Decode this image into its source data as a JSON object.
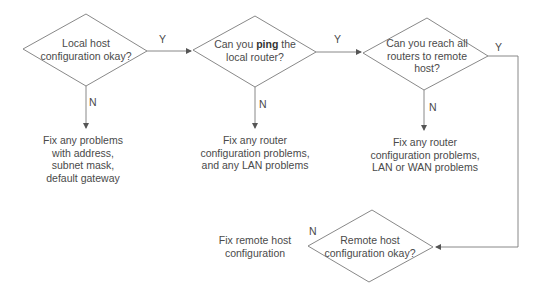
{
  "decisions": [
    {
      "id": "d1",
      "lines": [
        "Local host",
        "configuration okay?"
      ]
    },
    {
      "id": "d2",
      "lines_prefix": "Can you ",
      "bold": "ping",
      "lines_suffix": " the",
      "line2": "local router?"
    },
    {
      "id": "d3",
      "lines": [
        "Can you reach all",
        "routers to remote",
        "host?"
      ]
    },
    {
      "id": "d4",
      "lines": [
        "Remote host",
        "configuration okay?"
      ]
    }
  ],
  "actions": [
    {
      "id": "a1",
      "lines": [
        "Fix any problems",
        "with address,",
        "subnet mask,",
        "default gateway"
      ]
    },
    {
      "id": "a2",
      "lines": [
        "Fix any router",
        "configuration problems,",
        "and any LAN problems"
      ]
    },
    {
      "id": "a3",
      "lines": [
        "Fix any router",
        "configuration problems,",
        "LAN or WAN problems"
      ]
    },
    {
      "id": "a4",
      "lines": [
        "Fix remote host",
        "configuration"
      ]
    }
  ],
  "labels": {
    "yes": "Y",
    "no": "N"
  },
  "colors": {
    "stroke": "#7a7a7a",
    "text": "#4a4a4a",
    "background": "#ffffff"
  }
}
